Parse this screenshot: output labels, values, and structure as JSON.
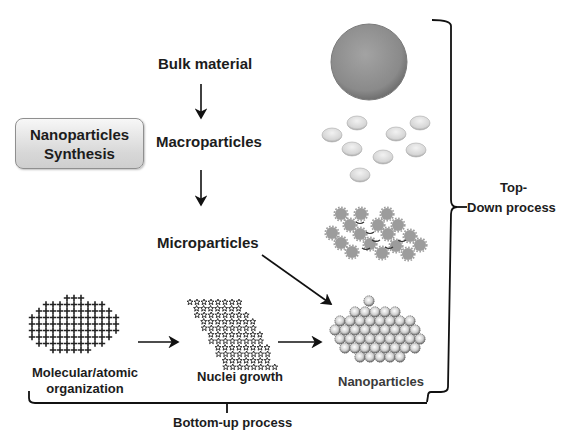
{
  "title_box": {
    "line1": "Nanoparticles",
    "line2": "Synthesis"
  },
  "top_down_chain": {
    "bulk": "Bulk material",
    "macro": "Macroparticles",
    "micro": "Microparticles"
  },
  "bottom_up_chain": {
    "molecular_line1": "Molecular/atomic",
    "molecular_line2": "organization",
    "nuclei": "Nuclei growth",
    "nano": "Nanoparticles"
  },
  "brackets": {
    "top_down_line1": "Top-",
    "top_down_line2": "Down process",
    "bottom_up": "Bottom-up process"
  },
  "colors": {
    "bulk_sphere": "#8e8e8e",
    "macro_particles": "#d9d9d9",
    "micro_particles": "#9a9a9a",
    "lines": "#111111"
  },
  "icons": [
    "bulk-sphere-icon",
    "macroparticle-cluster-icon",
    "microparticle-lattice-icon",
    "atomic-cross-grid-icon",
    "nuclei-star-cluster-icon",
    "nanoparticle-cluster-icon"
  ]
}
